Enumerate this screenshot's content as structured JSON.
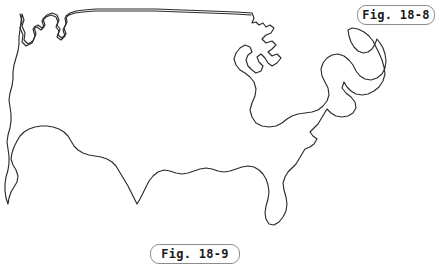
{
  "figure": {
    "kind": "outline-map",
    "background_color": "#ffffff",
    "outline_color": "#2b2b2b",
    "label_border_color": "#8c8c8c",
    "label_text_color": "#1a1a1a"
  },
  "labels": {
    "top_right": "Fig. 18-8",
    "bottom_center": "Fig. 18-9"
  }
}
